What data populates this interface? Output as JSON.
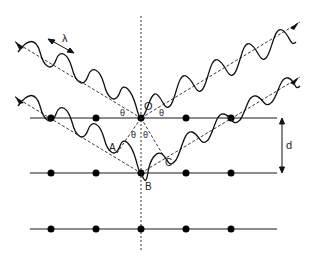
{
  "diagram": {
    "type": "bragg-diffraction",
    "labels": {
      "wavelength": "λ",
      "origin": "O",
      "point_a": "A",
      "point_b": "B",
      "point_c": "C",
      "spacing": "d",
      "theta": "θ"
    },
    "layers": [
      {
        "y": 118,
        "atoms_x": [
          51,
          96,
          141,
          186,
          231
        ]
      },
      {
        "y": 173,
        "atoms_x": [
          51,
          96,
          141,
          186,
          231
        ]
      },
      {
        "y": 229,
        "atoms_x": [
          51,
          96,
          141,
          186,
          231
        ]
      }
    ],
    "colors": {
      "stroke": "#1a1a1a",
      "background": "#ffffff"
    }
  }
}
